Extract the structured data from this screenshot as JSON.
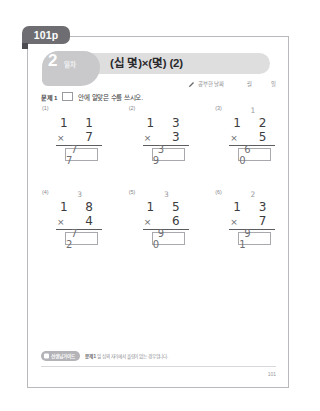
{
  "page_tab": {
    "label": "101p"
  },
  "header": {
    "day_number": "2",
    "day_label": "일차",
    "title": "(십 몇)×(몇) (2)",
    "pencil_icon": "pencil-icon",
    "date_label": "공부한 날짜",
    "month_label": "월",
    "day_unit_label": "일"
  },
  "instruction": {
    "tag": "문제 1",
    "text_before": "",
    "text_after": "안에 알맞은 수를 쓰시오."
  },
  "problems": [
    {
      "number": "(1)",
      "carry": "",
      "top": "1 1",
      "operator": "×",
      "bottom": "7",
      "answer": "7 7"
    },
    {
      "number": "(2)",
      "carry": "",
      "top": "1 3",
      "operator": "×",
      "bottom": "3",
      "answer": "3 9"
    },
    {
      "number": "(3)",
      "carry": "1",
      "top": "1 2",
      "operator": "×",
      "bottom": "5",
      "answer": "6 0"
    },
    {
      "number": "(4)",
      "carry": "3",
      "top": "1 8",
      "operator": "×",
      "bottom": "4",
      "answer": "7 2"
    },
    {
      "number": "(5)",
      "carry": "3",
      "top": "1 5",
      "operator": "×",
      "bottom": "6",
      "answer": "9 0"
    },
    {
      "number": "(6)",
      "carry": "2",
      "top": "1 3",
      "operator": "×",
      "bottom": "7",
      "answer": "9 1"
    }
  ],
  "footer": {
    "badge": "선생님 가이드",
    "note_prefix": "문제 1",
    "note_text": "일 십의 자리에서 올림이 없는 경우입니다.",
    "page_number": "101"
  },
  "colors": {
    "tab_bg": "#6e6e72",
    "band_bg": "#dededf",
    "blob_bg": "#c9c9cb",
    "text": "#3c3c3e",
    "answer_text": "#6e6e72"
  }
}
